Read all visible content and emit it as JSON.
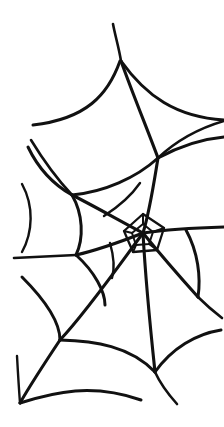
{
  "image": {
    "title": "Spider Web",
    "subject": "spider-web-line-drawing",
    "style": "hand-drawn black ink line art",
    "background_color": "#ffffff",
    "stroke_color": "#111111",
    "width": 224,
    "height": 427,
    "alt_text": "Hand-drawn black ink spider web with a small polygonal hub at center, radial spokes reaching the edges, and curved sagging spiral threads between them."
  },
  "web": {
    "hub": {
      "x": 143,
      "y": 233,
      "label": "web-hub"
    },
    "nodes": [
      {
        "name": "top-anchor",
        "x": 120,
        "y": 60
      },
      {
        "name": "upper-right-junction",
        "x": 158,
        "y": 158
      },
      {
        "name": "left-upper-junction",
        "x": 72,
        "y": 195
      },
      {
        "name": "left-mid-junction",
        "x": 76,
        "y": 255
      },
      {
        "name": "right-lower-junction",
        "x": 198,
        "y": 297
      },
      {
        "name": "lower-left-junction",
        "x": 60,
        "y": 340
      },
      {
        "name": "bottom-junction",
        "x": 155,
        "y": 372
      },
      {
        "name": "bottom-left-anchor",
        "x": 20,
        "y": 403
      }
    ],
    "radial_count": 8,
    "spiral_rings": 5,
    "hub_ring_count": 2
  }
}
